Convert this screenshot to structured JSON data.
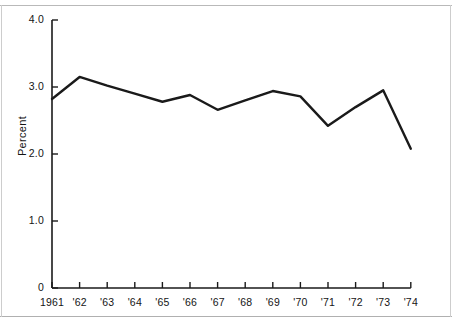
{
  "figure": {
    "background_color": "#ffffff",
    "line_color": "#1a1a1a",
    "axis_color": "#1a1a1a",
    "ylabel": "Percent"
  },
  "chart_data": {
    "type": "line",
    "title": "",
    "xlabel": "",
    "ylabel": "Percent",
    "categories": [
      "1961",
      "'62",
      "'63",
      "'64",
      "'65",
      "'66",
      "'67",
      "'68",
      "'69",
      "'70",
      "'71",
      "'72",
      "'73",
      "'74"
    ],
    "values": [
      2.82,
      3.15,
      3.02,
      2.9,
      2.78,
      2.88,
      2.66,
      2.8,
      2.94,
      2.86,
      2.42,
      2.7,
      2.95,
      2.08
    ],
    "series": [
      {
        "name": "Percent",
        "values": [
          2.82,
          3.15,
          3.02,
          2.9,
          2.78,
          2.88,
          2.66,
          2.8,
          2.94,
          2.86,
          2.42,
          2.7,
          2.95,
          2.08
        ]
      }
    ],
    "ylim": [
      0,
      4.0
    ],
    "yticks": [
      0,
      1.0,
      2.0,
      3.0,
      4.0
    ],
    "ytick_labels": [
      "0",
      "1.0",
      "2.0",
      "3.0",
      "4.0"
    ],
    "xtick_labels": [
      "1961",
      "'62",
      "'63",
      "'64",
      "'65",
      "'66",
      "'67",
      "'68",
      "'69",
      "'70",
      "'71",
      "'72",
      "'73",
      "'74"
    ],
    "grid": false,
    "legend": null,
    "markers": false,
    "annotations": []
  }
}
